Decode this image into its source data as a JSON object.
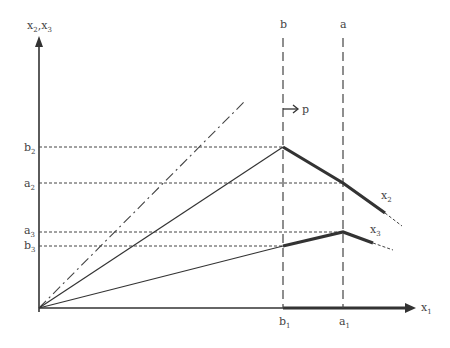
{
  "diagram": {
    "type": "economic-production-diagram",
    "axes": {
      "x_label": "x",
      "x_sub": "1",
      "y_label": "x",
      "y_sub1": "2",
      "y_sep": ",x",
      "y_sub2": "3"
    },
    "vertical_lines": [
      {
        "name": "b",
        "label": "b",
        "axis_label": "b",
        "axis_sub": "1"
      },
      {
        "name": "a",
        "label": "a",
        "axis_label": "a",
        "axis_sub": "1"
      }
    ],
    "horizontal_levels": [
      {
        "label": "b",
        "sub": "2"
      },
      {
        "label": "a",
        "sub": "2"
      },
      {
        "label": "a",
        "sub": "3"
      },
      {
        "label": "b",
        "sub": "3"
      }
    ],
    "curve_labels": [
      {
        "label": "x",
        "sub": "2"
      },
      {
        "label": "x",
        "sub": "3"
      }
    ],
    "arrow_label": "p",
    "colors": {
      "line": "#333333",
      "text": "#444444",
      "background": "#ffffff"
    }
  }
}
